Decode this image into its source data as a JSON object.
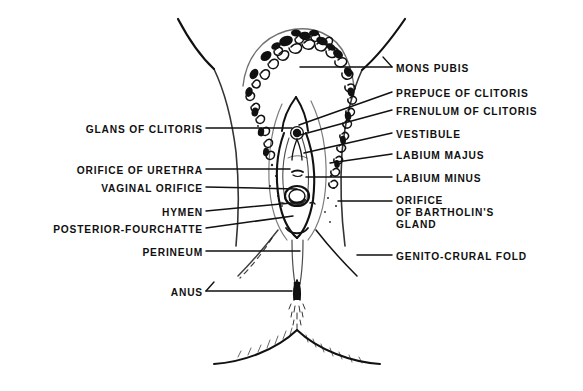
{
  "figure": {
    "ink_color": "#111111",
    "background_color": "#ffffff",
    "line_style": "ink line drawing with stipple shading"
  },
  "labels_left": [
    {
      "id": "glans-of-clitoris",
      "text": "GLANS OF CLITORIS",
      "x": 203,
      "y": 131,
      "leader_to_x": 292,
      "leader_to_y": 131
    },
    {
      "id": "orifice-of-urethra",
      "text": "ORIFICE OF URETHRA",
      "x": 203,
      "y": 172,
      "leader_to_x": 290,
      "leader_to_y": 172
    },
    {
      "id": "vaginal-orifice",
      "text": "VAGINAL ORIFICE",
      "x": 203,
      "y": 190,
      "leader_to_x": 296,
      "leader_to_y": 190
    },
    {
      "id": "hymen",
      "text": "HYMEN",
      "x": 203,
      "y": 214,
      "leader_to_x": 300,
      "leader_to_y": 205
    },
    {
      "id": "posterior-fourchatte",
      "text": "POSTERIOR-FOURCHATTE",
      "x": 203,
      "y": 231,
      "leader_to_x": 292,
      "leader_to_y": 219
    },
    {
      "id": "perineum",
      "text": "PERINEUM",
      "x": 203,
      "y": 254,
      "leader_to_x": 300,
      "leader_to_y": 254
    },
    {
      "id": "anus",
      "text": "ANUS",
      "x": 203,
      "y": 294,
      "leader_to_x": 292,
      "leader_to_y": 289
    }
  ],
  "labels_right": [
    {
      "id": "mons-pubis",
      "text": "MONS PUBIS",
      "x": 396,
      "y": 70,
      "leader_to_x": 300,
      "leader_to_y": 70
    },
    {
      "id": "prepuce-of-clitoris",
      "text": "PREPUCE OF CLITORIS",
      "x": 396,
      "y": 95,
      "leader_to_x": 291,
      "leader_to_y": 128
    },
    {
      "id": "frenulum-of-clitoris",
      "text": "FRENULUM OF CLITORIS",
      "x": 396,
      "y": 113,
      "leader_to_x": 292,
      "leader_to_y": 137
    },
    {
      "id": "vestibule",
      "text": "VESTIBULE",
      "x": 396,
      "y": 136,
      "leader_to_x": 296,
      "leader_to_y": 155
    },
    {
      "id": "labium-majus",
      "text": "LABIUM MAJUS",
      "x": 396,
      "y": 157,
      "leader_to_x": 330,
      "leader_to_y": 166
    },
    {
      "id": "labium-minus",
      "text": "LABIUM MINUS",
      "x": 396,
      "y": 180,
      "leader_to_x": 304,
      "leader_to_y": 180
    },
    {
      "id": "orifice-of-bartholins-gland",
      "text": "ORIFICE\nOF BARTHOLIN'S\nGLAND",
      "x": 396,
      "y": 200,
      "leader_to_x": 338,
      "leader_to_y": 203
    },
    {
      "id": "genito-crural-fold",
      "text": "GENITO-CRURAL FOLD",
      "x": 396,
      "y": 258,
      "leader_to_x": 357,
      "leader_to_y": 258
    }
  ]
}
